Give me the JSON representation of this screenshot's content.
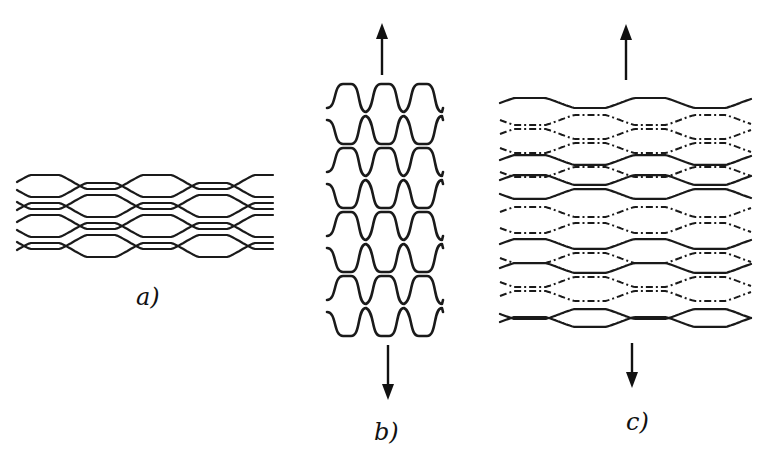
{
  "figure": {
    "panels": [
      {
        "id": "a",
        "label": "a)",
        "description": "Unstretched fabric: four pairs of interlaced loops, flattened horizontally",
        "label_pos": [
          136,
          285
        ],
        "x_start": 17,
        "x_end": 273,
        "pair_centers_y": [
          186,
          206,
          226,
          246
        ],
        "amplitude": 7,
        "period": 112,
        "line_style": "solid"
      },
      {
        "id": "b",
        "label": "b)",
        "description": "Fabric stretched vertically (walewise): loops elongate into tall wave rows",
        "label_pos": [
          374,
          420
        ],
        "x_start": 327,
        "x_end": 443,
        "row_tops_y": [
          84,
          116,
          148,
          180,
          212,
          244,
          276,
          308
        ],
        "row_height": 28,
        "crest_width": 38,
        "line_style": "solid",
        "arrows": [
          {
            "name": "stretch-up-arrow",
            "x": 382,
            "y_tail": 75,
            "y_tip": 23,
            "direction": "up"
          },
          {
            "name": "stretch-down-arrow",
            "x": 388,
            "y_tail": 345,
            "y_tip": 400,
            "direction": "down"
          }
        ]
      },
      {
        "id": "c",
        "label": "c)",
        "description": "Fabric stretched vertically with some loops shown hidden (dashed) behind the visible ones",
        "label_pos": [
          626,
          410
        ],
        "x_start": 500,
        "x_end": 751,
        "amplitude": 9,
        "period": 120,
        "rows": [
          {
            "y": 103,
            "style": "solid",
            "phase": 0
          },
          {
            "y": 120,
            "style": "dashed",
            "phase": 1
          },
          {
            "y": 134,
            "style": "dashed",
            "phase": 0
          },
          {
            "y": 148,
            "style": "dashed",
            "phase": 1
          },
          {
            "y": 160,
            "style": "solid",
            "phase": 0
          },
          {
            "y": 172,
            "style": "dashed",
            "phase": 1
          },
          {
            "y": 180,
            "style": "solid",
            "phase": 0
          },
          {
            "y": 194,
            "style": "solid",
            "phase": 1
          },
          {
            "y": 212,
            "style": "dashed",
            "phase": 0
          },
          {
            "y": 228,
            "style": "dashed",
            "phase": 1
          },
          {
            "y": 244,
            "style": "solid",
            "phase": 0
          },
          {
            "y": 258,
            "style": "dashed",
            "phase": 1
          },
          {
            "y": 268,
            "style": "solid",
            "phase": 0
          },
          {
            "y": 282,
            "style": "dashed",
            "phase": 1
          },
          {
            "y": 296,
            "style": "dashed",
            "phase": 0
          },
          {
            "y": 314,
            "style": "solid",
            "phase": 1
          },
          {
            "y": 322,
            "style": "solid",
            "phase": 0
          }
        ],
        "arrows": [
          {
            "name": "stretch-up-arrow",
            "x": 626,
            "y_tail": 80,
            "y_tip": 24,
            "direction": "up"
          },
          {
            "name": "stretch-down-arrow",
            "x": 632,
            "y_tail": 343,
            "y_tip": 388,
            "direction": "down"
          }
        ]
      }
    ]
  }
}
